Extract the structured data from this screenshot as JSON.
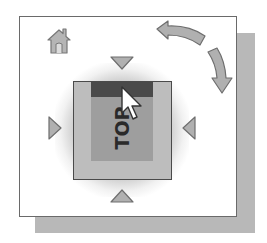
{
  "widget": {
    "type": "viewcube-navigation",
    "current_face_label": "TOP",
    "controls": {
      "home": {
        "icon": "home-icon"
      },
      "rotate_ccw": {
        "icon": "rotate-arrow-icon"
      },
      "rotate_cw": {
        "icon": "rotate-arrow-icon"
      },
      "nav_up": {
        "icon": "triangle-down-icon"
      },
      "nav_down": {
        "icon": "triangle-up-icon"
      },
      "nav_left": {
        "icon": "triangle-right-icon"
      },
      "nav_right": {
        "icon": "triangle-left-icon"
      }
    },
    "cursor": {
      "icon": "mouse-pointer-icon"
    }
  },
  "colors": {
    "frame_border": "#6a6a6a",
    "shadow": "#b8b8b8",
    "cube_outer": "#bdbdbd",
    "cube_face": "#9e9e9e",
    "cube_edge_highlight": "#4a4a4a",
    "arrow_fill": "#b0b0b0",
    "arrow_stroke": "#6e6e6e"
  }
}
